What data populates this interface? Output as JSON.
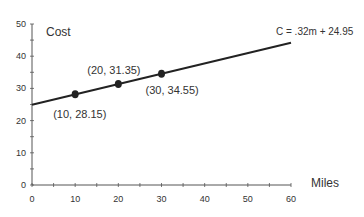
{
  "chart_data": {
    "type": "line",
    "title": "",
    "xlabel": "Miles",
    "ylabel": "Cost",
    "xlim": [
      0,
      60
    ],
    "ylim": [
      0,
      50
    ],
    "x_ticks": [
      0,
      10,
      20,
      30,
      40,
      50,
      60
    ],
    "y_ticks": [
      0,
      10,
      20,
      30,
      40,
      50
    ],
    "grid": false,
    "equation_label": "C = .32m + 24.95",
    "line": {
      "slope": 0.32,
      "intercept": 24.95,
      "x_start": 0,
      "x_end": 60
    },
    "points": [
      {
        "x": 10,
        "y": 28.15,
        "label": "(10, 28.15)"
      },
      {
        "x": 20,
        "y": 31.35,
        "label": "(20, 31.35)"
      },
      {
        "x": 30,
        "y": 34.55,
        "label": "(30, 34.55)"
      }
    ]
  },
  "colors": {
    "line": "#222222",
    "axis": "#555555",
    "text": "#333333"
  }
}
